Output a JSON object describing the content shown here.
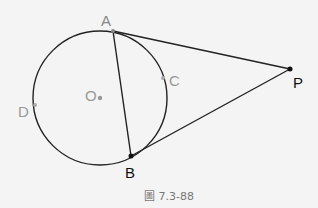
{
  "diagram": {
    "points": {
      "A": {
        "label": "A",
        "color": "#888888"
      },
      "B": {
        "label": "B",
        "color": "#111111"
      },
      "C": {
        "label": "C",
        "color": "#999999"
      },
      "D": {
        "label": "D",
        "color": "#999999"
      },
      "O": {
        "label": "O",
        "color": "#999999"
      },
      "P": {
        "label": "P",
        "color": "#111111"
      }
    },
    "segments": [
      "AB",
      "PA",
      "PB"
    ],
    "circle": {
      "center": "O",
      "through": [
        "A",
        "B",
        "C",
        "D"
      ]
    },
    "caption": "圖 7.3-88"
  }
}
